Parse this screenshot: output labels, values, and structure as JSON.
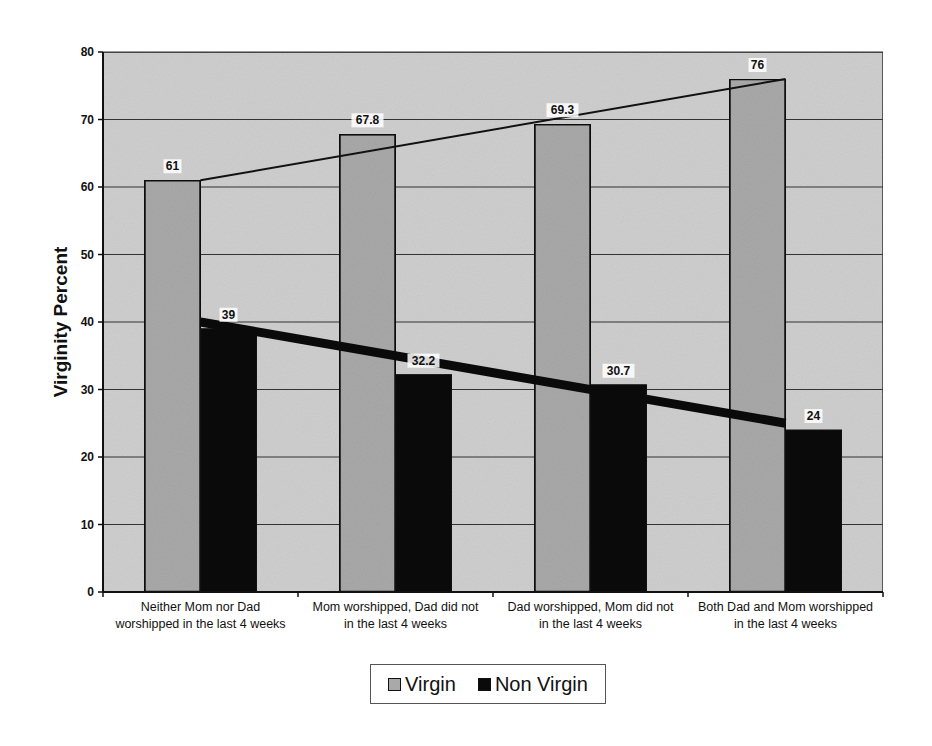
{
  "chart_data": {
    "type": "bar",
    "title": "",
    "xlabel": "",
    "ylabel": "Virginity Percent",
    "ylim": [
      0,
      80
    ],
    "yticks": [
      0,
      10,
      20,
      30,
      40,
      50,
      60,
      70,
      80
    ],
    "grid": true,
    "legend_position": "bottom",
    "categories": [
      [
        "Neither Mom nor Dad",
        "worshipped in the last 4 weeks"
      ],
      [
        "Mom worshipped, Dad did not",
        "in the last 4 weeks"
      ],
      [
        "Dad worshipped, Mom did not",
        "in the last 4 weeks"
      ],
      [
        "Both Dad and Mom worshipped",
        "in the last 4 weeks"
      ]
    ],
    "series": [
      {
        "name": "Virgin",
        "values": [
          61,
          67.8,
          69.3,
          76
        ],
        "labels": [
          "61",
          "67.8",
          "69.3",
          "76"
        ],
        "color": "#a9a9a9"
      },
      {
        "name": "Non Virgin",
        "values": [
          39,
          32.2,
          30.7,
          24
        ],
        "labels": [
          "39",
          "32.2",
          "30.7",
          "24"
        ],
        "color": "#0a0a0a"
      }
    ],
    "trendlines": [
      {
        "series": "Virgin",
        "from": 61,
        "to": 76,
        "width": 2
      },
      {
        "series": "Non Virgin",
        "from": 40,
        "to": 25,
        "width": 9
      }
    ]
  },
  "colors": {
    "plot_background": "#cfcfcf",
    "virgin_bar": "#a9a9a9",
    "nonvirgin_bar": "#0a0a0a",
    "gridline": "#333333"
  },
  "legend": {
    "items": [
      {
        "label": "Virgin",
        "icon": "light-gray-square-icon"
      },
      {
        "label": "Non Virgin",
        "icon": "black-square-icon"
      }
    ]
  }
}
